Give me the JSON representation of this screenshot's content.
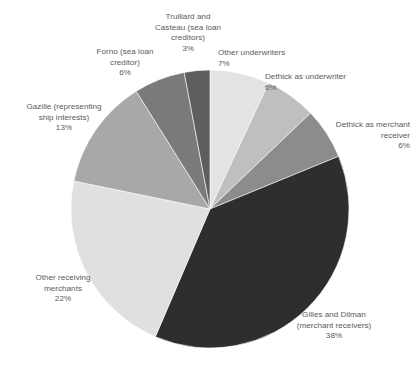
{
  "chart_data": {
    "type": "pie",
    "title": "",
    "subtitle": "",
    "xlabel": "",
    "ylabel": "",
    "legend_position": "none",
    "grid": false,
    "start_angle_deg": 0,
    "direction": "clockwise",
    "categories": [
      "Other underwriters",
      "Dethick as underwriter",
      "Dethick as merchant receiver",
      "Gilles and Dilman (merchant receivers)",
      "Other receiving merchants",
      "Gazille (representing ship interests)",
      "Forno (sea loan creditor)",
      "Truillard and Casteau (sea loan creditors)"
    ],
    "values": [
      7,
      6,
      6,
      38,
      22,
      13,
      6,
      3
    ],
    "value_labels": [
      "7%",
      "6%",
      "6%",
      "38%",
      "22%",
      "13%",
      "6%",
      "3%"
    ],
    "colors": [
      "#e3e3e3",
      "#bfbfbf",
      "#8c8c8c",
      "#2e2e2e",
      "#e0e0e0",
      "#a8a8a8",
      "#7a7a7a",
      "#5e5e5e"
    ],
    "slices": [
      {
        "label": "Other underwriters",
        "label_lines": "Other underwriters",
        "value": 7,
        "pct": "7%",
        "color": "#e3e3e3"
      },
      {
        "label": "Dethick as underwriter",
        "label_lines": "Dethick as underwriter",
        "value": 6,
        "pct": "6%",
        "color": "#bfbfbf"
      },
      {
        "label": "Dethick as merchant receiver",
        "label_lines": "Dethick as merchant\nreceiver",
        "value": 6,
        "pct": "6%",
        "color": "#8c8c8c"
      },
      {
        "label": "Gilles and Dilman (merchant receivers)",
        "label_lines": "Gilles and Dilman\n(merchant receivers)",
        "value": 38,
        "pct": "38%",
        "color": "#2e2e2e"
      },
      {
        "label": "Other receiving merchants",
        "label_lines": "Other receiving\nmerchants",
        "value": 22,
        "pct": "22%",
        "color": "#e0e0e0"
      },
      {
        "label": "Gazille (representing ship interests)",
        "label_lines": "Gazille (representing\nship interests)",
        "value": 13,
        "pct": "13%",
        "color": "#a8a8a8"
      },
      {
        "label": "Forno (sea loan creditor)",
        "label_lines": "Forno (sea loan\ncreditor)",
        "value": 6,
        "pct": "6%",
        "color": "#7a7a7a"
      },
      {
        "label": "Truillard and Casteau (sea loan creditors)",
        "label_lines": "Truillard and\nCasteau (sea loan\ncreditors)",
        "value": 3,
        "pct": "3%",
        "color": "#5e5e5e"
      }
    ],
    "geometry": {
      "cx": 210,
      "cy": 209,
      "r": 139
    },
    "label_positions": [
      {
        "x": 218,
        "y": 48,
        "w": 100,
        "align": "lbl-left"
      },
      {
        "x": 265,
        "y": 72,
        "w": 150,
        "align": "lbl-left"
      },
      {
        "x": 255,
        "y": 120,
        "w": 155,
        "align": "lbl-right"
      },
      {
        "x": 258,
        "y": 310,
        "w": 152,
        "align": "lbl-center"
      },
      {
        "x": 8,
        "y": 273,
        "w": 110,
        "align": "lbl-center"
      },
      {
        "x": 4,
        "y": 102,
        "w": 120,
        "align": "lbl-center"
      },
      {
        "x": 70,
        "y": 47,
        "w": 110,
        "align": "lbl-center"
      },
      {
        "x": 133,
        "y": 12,
        "w": 110,
        "align": "lbl-center"
      }
    ]
  }
}
